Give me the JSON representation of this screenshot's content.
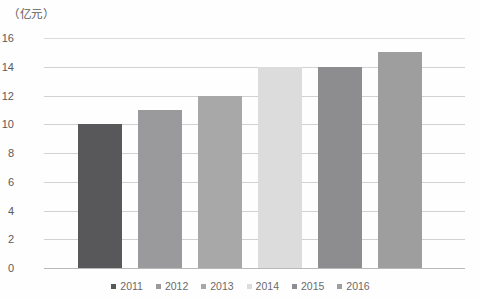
{
  "chart_data": {
    "type": "bar",
    "title": "",
    "subtitle": "",
    "xlabel": "",
    "ylabel": "（亿元）",
    "ylim": [
      0,
      16
    ],
    "grid": true,
    "legend_position": "bottom",
    "categories": [
      "2011",
      "2012",
      "2013",
      "2014",
      "2015",
      "2016"
    ],
    "values": [
      10,
      11,
      12,
      14,
      14,
      15
    ],
    "ytick_labels": [
      "0",
      "2",
      "4",
      "6",
      "8",
      "10",
      "12",
      "14",
      "16"
    ],
    "ytick_values": [
      0,
      2,
      4,
      6,
      8,
      10,
      12,
      14,
      16
    ],
    "series": [
      {
        "name": "年度数值",
        "values": [
          10,
          11,
          12,
          14,
          14,
          15
        ]
      }
    ],
    "bar_colors": [
      "#58585a",
      "#9a9a9c",
      "#a8a8a9",
      "#dcdcdc",
      "#8d8d8f",
      "#9e9e9f"
    ],
    "legend": [
      {
        "label": "2011",
        "color": "#58585a",
        "value": 10
      },
      {
        "label": "2012",
        "color": "#9a9a9c",
        "value": 11
      },
      {
        "label": "2013",
        "color": "#a8a8a9",
        "value": 12
      },
      {
        "label": "2014",
        "color": "#dcdcdc",
        "value": 14
      },
      {
        "label": "2015",
        "color": "#8d8d8f",
        "value": 14
      },
      {
        "label": "2016",
        "color": "#9e9e9f",
        "value": 15
      }
    ],
    "colors": {
      "gridline": "#d2d2d2",
      "baseline": "#b9b9b9",
      "tick_text": "#5a5a5a",
      "legend_text": "#6a6a6a",
      "background": "#fefefe"
    }
  }
}
